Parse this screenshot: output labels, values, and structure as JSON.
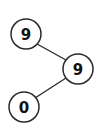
{
  "diagram": {
    "type": "binary-tree",
    "nodes": [
      {
        "id": "n1",
        "label": "9",
        "cx": 26,
        "cy": 34
      },
      {
        "id": "n2",
        "label": "9",
        "cx": 78,
        "cy": 69
      },
      {
        "id": "n3",
        "label": "0",
        "cx": 24,
        "cy": 107
      }
    ],
    "edges": [
      {
        "from": "n1",
        "to": "n2"
      },
      {
        "from": "n2",
        "to": "n3"
      }
    ],
    "colors": {
      "stroke": "#2b2b2b",
      "fill": "#ffffff",
      "text": "#111111"
    }
  }
}
